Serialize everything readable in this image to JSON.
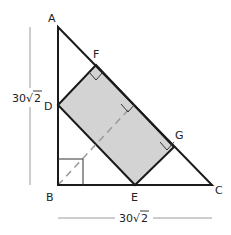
{
  "diagram": {
    "points": {
      "A": {
        "label": "A",
        "x": 58,
        "y": 27
      },
      "B": {
        "label": "B",
        "x": 58,
        "y": 185
      },
      "C": {
        "label": "C",
        "x": 212,
        "y": 185
      },
      "D": {
        "label": "D",
        "x": 58,
        "y": 105
      },
      "E": {
        "label": "E",
        "x": 135,
        "y": 185
      },
      "F": {
        "label": "F",
        "x": 96,
        "y": 65
      },
      "G": {
        "label": "G",
        "x": 174,
        "y": 147
      }
    },
    "dimensions": {
      "left": {
        "coef": "30",
        "radicand": "2"
      },
      "bottom": {
        "coef": "30",
        "radicand": "2"
      }
    },
    "colors": {
      "stroke": "#1a1a1a",
      "fill": "#d3d3d3",
      "dashed": "#9a9a9a",
      "dimension_line": "#9a9a9a"
    }
  }
}
